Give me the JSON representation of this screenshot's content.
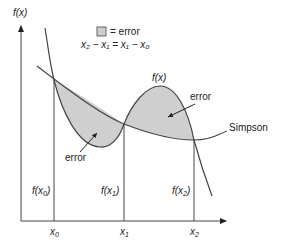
{
  "diagram": {
    "y_axis_label": "f(x)",
    "x_ticks": [
      {
        "label": "x",
        "sub": "0"
      },
      {
        "label": "x",
        "sub": "1"
      },
      {
        "label": "x",
        "sub": "2"
      }
    ],
    "ordinate_labels": [
      {
        "label": "f(x",
        "sub": "0",
        "close": ")"
      },
      {
        "label": "f(x",
        "sub": "1",
        "close": ")"
      },
      {
        "label": "f(x",
        "sub": "2",
        "close": ")"
      }
    ],
    "legend": {
      "swatch_label": "= error",
      "equation": "x₂ − x₁ = x₁ − x₀"
    },
    "curve_labels": {
      "function": "f(x)",
      "approximation": "Simpson"
    },
    "annotations": [
      {
        "text": "error",
        "region": "left"
      },
      {
        "text": "error",
        "region": "right"
      }
    ],
    "colors": {
      "fill": "#cfcfcf",
      "line": "#444444",
      "background": "#ffffff"
    }
  }
}
